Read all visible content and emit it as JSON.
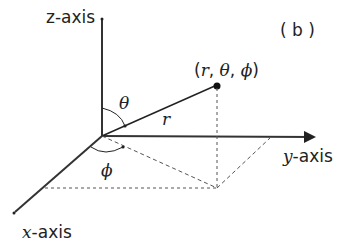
{
  "diagram": {
    "panel_label": "( b )",
    "axes": {
      "z": {
        "var": "z",
        "suffix": "-axis"
      },
      "y": {
        "var": "y",
        "suffix": "-axis"
      },
      "x": {
        "var": "x",
        "suffix": "-axis"
      }
    },
    "point_label": {
      "open": "(",
      "r": "r",
      "sep1": ", ",
      "theta": "θ",
      "sep2": ", ",
      "phi": "ϕ",
      "close": ")"
    },
    "radius_label": "r",
    "theta_label": "θ",
    "phi_label": "ϕ",
    "colors": {
      "line": "#222222",
      "dashed": "#555555",
      "background": "#ffffff"
    }
  }
}
